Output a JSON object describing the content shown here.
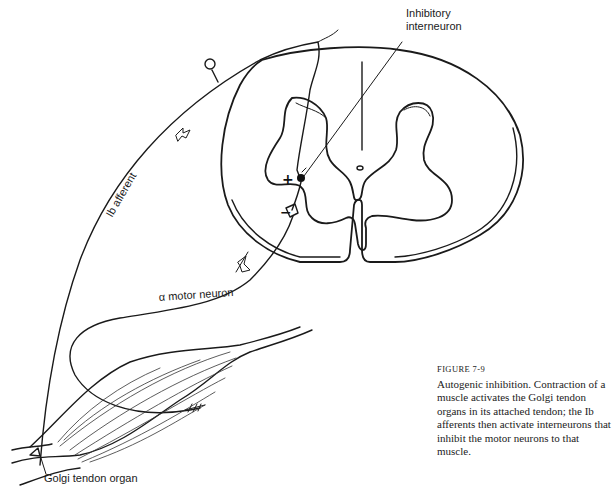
{
  "figure": {
    "number": "FIGURE 7-9",
    "caption": "Autogenic inhibition. Contraction of a muscle activates the Golgi tendon organs in its attached tendon; the Ib afferents then activate interneurons that inhibit the motor neurons to that muscle."
  },
  "labels": {
    "inhibitory_interneuron_line1": "Inhibitory",
    "inhibitory_interneuron_line2": "interneuron",
    "ib_afferent": "Ib afferent",
    "alpha_motor_neuron": "α motor neuron",
    "golgi_tendon_organ": "Golgi tendon organ"
  },
  "signs": {
    "excitatory": "+",
    "inhibitory": "−"
  },
  "colors": {
    "ink": "#1a1a1a",
    "background": "#ffffff"
  }
}
